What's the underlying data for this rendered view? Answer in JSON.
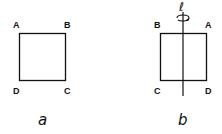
{
  "figure_a": {
    "caption": "a",
    "vertices": {
      "top_left": "A",
      "top_right": "B",
      "bottom_left": "D",
      "bottom_right": "C"
    }
  },
  "figure_b": {
    "caption": "b",
    "axis_label": "ℓ",
    "vertices": {
      "top_left": "B",
      "top_right": "A",
      "bottom_left": "C",
      "bottom_right": "D"
    }
  }
}
